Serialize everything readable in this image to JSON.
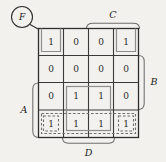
{
  "diagram": {
    "type": "karnaugh-map",
    "function_label": "F",
    "rows": 4,
    "cols": 4,
    "cells": [
      [
        "1",
        "0",
        "0",
        "1"
      ],
      [
        "0",
        "0",
        "0",
        "0"
      ],
      [
        "0",
        "1",
        "1",
        "0"
      ],
      [
        "1",
        "1",
        "1",
        "1"
      ]
    ],
    "variable_labels": {
      "top": "C",
      "right": "B",
      "left": "A",
      "bottom": "D"
    },
    "groups": [
      {
        "name": "group-top-left-corner",
        "style": "solid",
        "cells": "r1c1"
      },
      {
        "name": "group-top-right-corner",
        "style": "solid",
        "cells": "r1c4"
      },
      {
        "name": "group-center-block",
        "style": "solid",
        "cells": "r3c2-r4c3"
      },
      {
        "name": "group-bottom-row",
        "style": "dashed",
        "cells": "r4c1-r4c4"
      },
      {
        "name": "group-bottom-left-corner",
        "style": "dashed",
        "cells": "r4c1"
      },
      {
        "name": "group-bottom-right-corner",
        "style": "dashed",
        "cells": "r4c4"
      }
    ],
    "colors": {
      "background": "#f2f1ee",
      "grid": "#3a3a3a",
      "group_solid": "#8d8d8d",
      "group_dashed": "#6f6f6f",
      "bracket": "#6d6d6d",
      "text": "#2b2b2b"
    }
  }
}
